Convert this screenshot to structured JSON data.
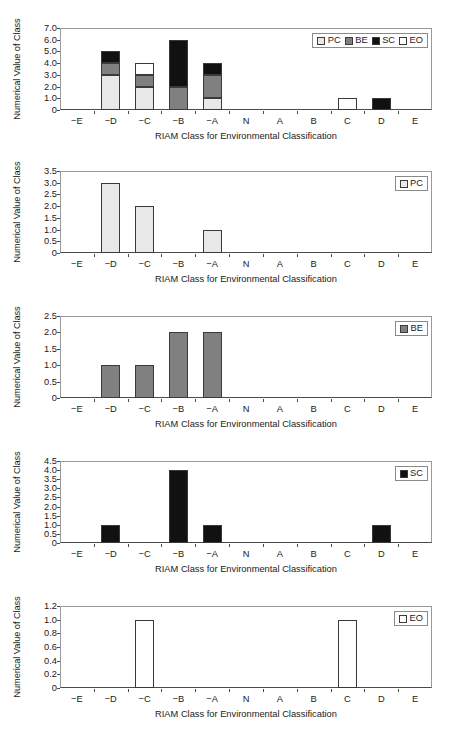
{
  "figure": {
    "categories": [
      "−E",
      "−D",
      "−C",
      "−B",
      "−A",
      "N",
      "A",
      "B",
      "C",
      "D",
      "E"
    ],
    "xlabel": "RIAM Class for Environmental Classification",
    "ylabel": "Numerical Value of Class",
    "colors": {
      "PC": "#e8e8e8",
      "BE": "#808080",
      "SC": "#111111",
      "EO": "#ffffff"
    }
  },
  "chart_data": [
    {
      "type": "bar",
      "stacked": true,
      "panel": "combined",
      "title": "",
      "xlabel": "RIAM Class for Environmental Classification",
      "ylabel": "Numerical Value of Class",
      "categories": [
        "−E",
        "−D",
        "−C",
        "−B",
        "−A",
        "N",
        "A",
        "B",
        "C",
        "D",
        "E"
      ],
      "yticks": [
        "0",
        "1.0",
        "2.0",
        "3.0",
        "4.0",
        "5.0",
        "6.0",
        "7.0"
      ],
      "ytickvalues": [
        0,
        1,
        2,
        3,
        4,
        5,
        6,
        7
      ],
      "ylim": [
        0,
        7
      ],
      "grid": false,
      "legend": {
        "position": "top-right",
        "entries": [
          {
            "label": "PC",
            "color": "#e8e8e8"
          },
          {
            "label": "BE",
            "color": "#808080"
          },
          {
            "label": "SC",
            "color": "#111111"
          },
          {
            "label": "EO",
            "color": "#ffffff"
          }
        ]
      },
      "series": [
        {
          "name": "PC",
          "color": "#e8e8e8",
          "values": [
            0,
            3,
            2,
            0,
            1,
            0,
            0,
            0,
            0,
            0,
            0
          ]
        },
        {
          "name": "BE",
          "color": "#808080",
          "values": [
            0,
            1,
            1,
            2,
            2,
            0,
            0,
            0,
            0,
            0,
            0
          ]
        },
        {
          "name": "SC",
          "color": "#111111",
          "values": [
            0,
            1,
            0,
            4,
            1,
            0,
            0,
            0,
            0,
            1,
            0
          ]
        },
        {
          "name": "EO",
          "color": "#ffffff",
          "values": [
            0,
            0,
            1,
            0,
            0,
            0,
            0,
            0,
            1,
            0,
            0
          ]
        }
      ],
      "totals": [
        0,
        5,
        4,
        6,
        4,
        0,
        0,
        0,
        0,
        1,
        0
      ]
    },
    {
      "type": "bar",
      "stacked": false,
      "panel": "PC",
      "title": "",
      "xlabel": "RIAM Class for Environmental Classification",
      "ylabel": "Numerical Value of Class",
      "categories": [
        "−E",
        "−D",
        "−C",
        "−B",
        "−A",
        "N",
        "A",
        "B",
        "C",
        "D",
        "E"
      ],
      "yticks": [
        "0",
        "0.5",
        "1.0",
        "1.5",
        "2.0",
        "2.5",
        "3.0",
        "3.5"
      ],
      "ytickvalues": [
        0,
        0.5,
        1.0,
        1.5,
        2.0,
        2.5,
        3.0,
        3.5
      ],
      "ylim": [
        0,
        3.5
      ],
      "grid": false,
      "legend": {
        "position": "top-right",
        "entries": [
          {
            "label": "PC",
            "color": "#e8e8e8"
          }
        ]
      },
      "series": [
        {
          "name": "PC",
          "color": "#e8e8e8",
          "values": [
            0,
            3,
            2,
            0,
            1,
            0,
            0,
            0,
            0,
            0,
            0
          ]
        }
      ]
    },
    {
      "type": "bar",
      "stacked": false,
      "panel": "BE",
      "title": "",
      "xlabel": "RIAM Class for Environmental Classification",
      "ylabel": "Numerical Value of Class",
      "categories": [
        "−E",
        "−D",
        "−C",
        "−B",
        "−A",
        "N",
        "A",
        "B",
        "C",
        "D",
        "E"
      ],
      "yticks": [
        "0",
        "0.5",
        "1.0",
        "1.5",
        "2.0",
        "2.5"
      ],
      "ytickvalues": [
        0,
        0.5,
        1.0,
        1.5,
        2.0,
        2.5
      ],
      "ylim": [
        0,
        2.5
      ],
      "grid": false,
      "legend": {
        "position": "top-right",
        "entries": [
          {
            "label": "BE",
            "color": "#808080"
          }
        ]
      },
      "series": [
        {
          "name": "BE",
          "color": "#808080",
          "values": [
            0,
            1,
            1,
            2,
            2,
            0,
            0,
            0,
            0,
            0,
            0
          ]
        }
      ]
    },
    {
      "type": "bar",
      "stacked": false,
      "panel": "SC",
      "title": "",
      "xlabel": "RIAM Class for Environmental Classification",
      "ylabel": "Numerical Value of Class",
      "categories": [
        "−E",
        "−D",
        "−C",
        "−B",
        "−A",
        "N",
        "A",
        "B",
        "C",
        "D",
        "E"
      ],
      "yticks": [
        "0",
        "0.5",
        "1.0",
        "1.5",
        "2.0",
        "2.5",
        "3.0",
        "3.5",
        "4.0",
        "4.5"
      ],
      "ytickvalues": [
        0,
        0.5,
        1.0,
        1.5,
        2.0,
        2.5,
        3.0,
        3.5,
        4.0,
        4.5
      ],
      "ylim": [
        0,
        4.5
      ],
      "grid": false,
      "legend": {
        "position": "top-right",
        "entries": [
          {
            "label": "SC",
            "color": "#111111"
          }
        ]
      },
      "series": [
        {
          "name": "SC",
          "color": "#111111",
          "values": [
            0,
            1,
            0,
            4,
            1,
            0,
            0,
            0,
            0,
            1,
            0
          ]
        }
      ]
    },
    {
      "type": "bar",
      "stacked": false,
      "panel": "EO",
      "title": "",
      "xlabel": "RIAM Class for Environmental Classification",
      "ylabel": "Numerical Value of Class",
      "categories": [
        "−E",
        "−D",
        "−C",
        "−B",
        "−A",
        "N",
        "A",
        "B",
        "C",
        "D",
        "E"
      ],
      "yticks": [
        "0",
        "0.2",
        "0.4",
        "0.6",
        "0.8",
        "1.0",
        "1.2"
      ],
      "ytickvalues": [
        0,
        0.2,
        0.4,
        0.6,
        0.8,
        1.0,
        1.2
      ],
      "ylim": [
        0,
        1.2
      ],
      "grid": false,
      "legend": {
        "position": "top-right",
        "entries": [
          {
            "label": "EO",
            "color": "#ffffff"
          }
        ]
      },
      "series": [
        {
          "name": "EO",
          "color": "#ffffff",
          "values": [
            0,
            0,
            1,
            0,
            0,
            0,
            0,
            0,
            1,
            0,
            0
          ]
        }
      ]
    }
  ]
}
